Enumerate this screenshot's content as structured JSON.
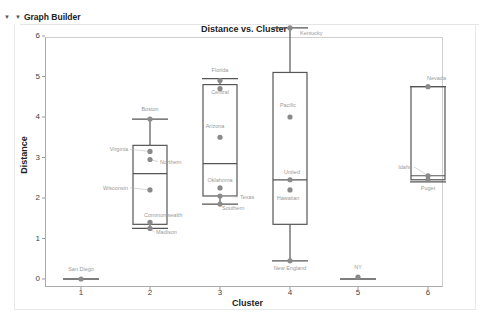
{
  "panel": {
    "title": "Graph Builder",
    "expand_icon": "disclosure-triangle-icon",
    "menu_icon": "red-triangle-menu-icon"
  },
  "chart_data": {
    "type": "boxplot",
    "title": "Distance vs. Cluster",
    "xlabel": "Cluster",
    "ylabel": "Distance",
    "categories": [
      "1",
      "2",
      "3",
      "4",
      "5",
      "6"
    ],
    "yticks": [
      "0",
      "1",
      "2",
      "3",
      "4",
      "5",
      "6"
    ],
    "ylim": [
      0,
      6.3
    ],
    "grid": false,
    "boxes": [
      {
        "cluster": "1",
        "min": 0.0,
        "q1": 0.0,
        "median": 0.0,
        "q3": 0.0,
        "max": 0.0
      },
      {
        "cluster": "2",
        "min": 1.25,
        "q1": 1.35,
        "median": 2.6,
        "q3": 3.3,
        "max": 3.95
      },
      {
        "cluster": "3",
        "min": 1.85,
        "q1": 2.05,
        "median": 2.85,
        "q3": 4.8,
        "max": 4.95
      },
      {
        "cluster": "4",
        "min": 0.45,
        "q1": 1.35,
        "median": 2.45,
        "q3": 5.1,
        "max": 6.2
      },
      {
        "cluster": "5",
        "min": 0.0,
        "q1": 0.0,
        "median": 0.0,
        "q3": 0.0,
        "max": 0.0
      },
      {
        "cluster": "6",
        "min": 2.4,
        "q1": 2.45,
        "median": 2.55,
        "q3": 4.75,
        "max": 4.75
      }
    ],
    "points": [
      {
        "cluster": "1",
        "y": 0.0,
        "label": "San Diego"
      },
      {
        "cluster": "2",
        "y": 3.95,
        "label": "Boston"
      },
      {
        "cluster": "2",
        "y": 3.15,
        "label": "Virginia"
      },
      {
        "cluster": "2",
        "y": 2.95,
        "label": "Northern"
      },
      {
        "cluster": "2",
        "y": 2.2,
        "label": "Wisconsin"
      },
      {
        "cluster": "2",
        "y": 1.4,
        "label": "Commonwealth"
      },
      {
        "cluster": "2",
        "y": 1.25,
        "label": "Madison"
      },
      {
        "cluster": "3",
        "y": 4.9,
        "label": "Florida"
      },
      {
        "cluster": "3",
        "y": 4.7,
        "label": "Central"
      },
      {
        "cluster": "3",
        "y": 3.5,
        "label": "Arizona"
      },
      {
        "cluster": "3",
        "y": 2.25,
        "label": "Oklahoma"
      },
      {
        "cluster": "3",
        "y": 2.05,
        "label": "Texas"
      },
      {
        "cluster": "3",
        "y": 1.85,
        "label": "Southern"
      },
      {
        "cluster": "4",
        "y": 6.2,
        "label": "Kentucky"
      },
      {
        "cluster": "4",
        "y": 4.0,
        "label": "Pacific"
      },
      {
        "cluster": "4",
        "y": 2.45,
        "label": "United"
      },
      {
        "cluster": "4",
        "y": 2.2,
        "label": "Hawaiian"
      },
      {
        "cluster": "4",
        "y": 0.45,
        "label": "New England"
      },
      {
        "cluster": "5",
        "y": 0.05,
        "label": "NY"
      },
      {
        "cluster": "6",
        "y": 4.75,
        "label": "Nevada"
      },
      {
        "cluster": "6",
        "y": 2.55,
        "label": "Idaho"
      },
      {
        "cluster": "6",
        "y": 2.45,
        "label": "Puget"
      }
    ]
  }
}
